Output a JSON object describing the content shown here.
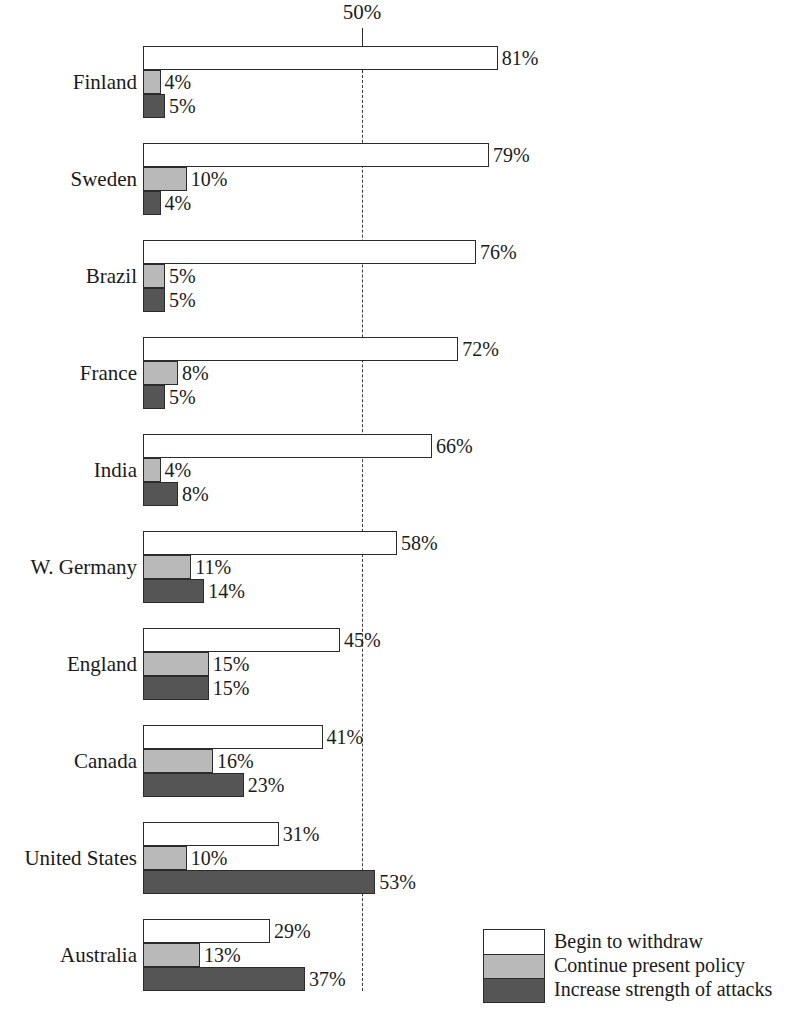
{
  "chart_data": {
    "type": "bar",
    "orientation": "horizontal",
    "grouped": true,
    "title": "",
    "xlabel": "",
    "ylabel": "",
    "xlim": [
      0,
      85
    ],
    "grid": false,
    "reference_line": {
      "label": "50%",
      "value": 50,
      "style": "dashed"
    },
    "legend_position": "bottom-right",
    "categories": [
      "Finland",
      "Sweden",
      "Brazil",
      "France",
      "India",
      "W. Germany",
      "England",
      "Canada",
      "United States",
      "Australia"
    ],
    "series": [
      {
        "name": "Begin to withdraw",
        "key": "withdraw",
        "color": "#ffffff",
        "values": [
          81,
          79,
          76,
          72,
          66,
          58,
          45,
          41,
          31,
          29
        ]
      },
      {
        "name": "Continue present policy",
        "key": "continue",
        "color": "#b9b9b9",
        "values": [
          4,
          10,
          5,
          8,
          4,
          11,
          15,
          16,
          10,
          13
        ]
      },
      {
        "name": "Increase strength of attacks",
        "key": "increase",
        "color": "#555555",
        "values": [
          5,
          4,
          5,
          5,
          8,
          14,
          15,
          23,
          53,
          37
        ]
      }
    ],
    "value_labels": [
      {
        "country": "Finland",
        "withdraw": "81%",
        "continue": "4%",
        "increase": "5%"
      },
      {
        "country": "Sweden",
        "withdraw": "79%",
        "continue": "10%",
        "increase": "4%"
      },
      {
        "country": "Brazil",
        "withdraw": "76%",
        "continue": "5%",
        "increase": "5%"
      },
      {
        "country": "France",
        "withdraw": "72%",
        "continue": "8%",
        "increase": "5%"
      },
      {
        "country": "India",
        "withdraw": "66%",
        "continue": "4%",
        "increase": "8%"
      },
      {
        "country": "W. Germany",
        "withdraw": "58%",
        "continue": "11%",
        "increase": "14%"
      },
      {
        "country": "England",
        "withdraw": "45%",
        "continue": "15%",
        "increase": "15%"
      },
      {
        "country": "Canada",
        "withdraw": "41%",
        "continue": "16%",
        "increase": "23%"
      },
      {
        "country": "United States",
        "withdraw": "31%",
        "continue": "10%",
        "increase": "53%"
      },
      {
        "country": "Australia",
        "withdraw": "29%",
        "continue": "13%",
        "increase": "37%"
      }
    ]
  },
  "axis": {
    "reference_label": "50%"
  },
  "legend": {
    "items": [
      {
        "label": "Begin to withdraw",
        "swatch": "white-swatch-icon"
      },
      {
        "label": "Continue present policy",
        "swatch": "light-gray-swatch-icon"
      },
      {
        "label": "Increase strength of attacks",
        "swatch": "dark-gray-swatch-icon"
      }
    ]
  },
  "colors": {
    "withdraw": "#ffffff",
    "continue": "#b9b9b9",
    "increase": "#555555",
    "outline": "#2b2b2b",
    "text": "#1a1a1a",
    "background": "#ffffff"
  }
}
